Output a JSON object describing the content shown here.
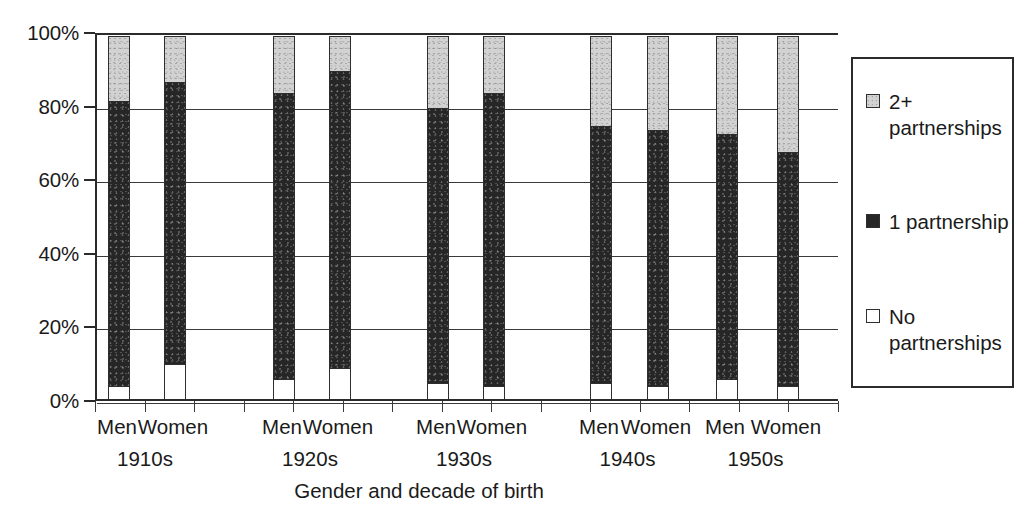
{
  "chart_data": {
    "type": "bar",
    "subtype": "stacked-100-percent-column",
    "title": "",
    "xlabel": "Gender and decade of birth",
    "ylabel": "",
    "ylim": [
      0,
      100
    ],
    "ytick_labels": [
      "0%",
      "20%",
      "40%",
      "60%",
      "80%",
      "100%"
    ],
    "ytick_values": [
      0,
      20,
      40,
      60,
      80,
      100
    ],
    "grid": true,
    "legend_position": "right",
    "categories": [
      "Men 1910s",
      "Women 1910s",
      "Men 1920s",
      "Women 1920s",
      "Men 1930s",
      "Women 1930s",
      "Men 1940s",
      "Women 1940s",
      "Men 1950s",
      "Women 1950s"
    ],
    "group_labels": [
      "1910s",
      "1920s",
      "1930s",
      "1940s",
      "1950s"
    ],
    "gender_labels": [
      "Men",
      "Women"
    ],
    "series": [
      {
        "name": "No partnerships",
        "color": "#ffffff",
        "values": [
          4,
          10,
          6,
          9,
          5,
          4,
          5,
          4,
          6,
          4
        ]
      },
      {
        "name": "1 partnership",
        "color": "#262626",
        "values": [
          78,
          77,
          78,
          81,
          75,
          80,
          70,
          70,
          67,
          64
        ]
      },
      {
        "name": "2+ partnerships",
        "color": "#d2d2d2",
        "values": [
          18,
          13,
          16,
          10,
          20,
          16,
          25,
          26,
          27,
          32
        ]
      }
    ],
    "cumulative_tops": {
      "no_partnerships": [
        4,
        10,
        6,
        9,
        5,
        4,
        5,
        4,
        6,
        4
      ],
      "one_partnership": [
        82,
        87,
        84,
        90,
        80,
        84,
        75,
        74,
        73,
        68
      ],
      "two_plus": [
        100,
        100,
        100,
        100,
        100,
        100,
        100,
        100,
        100,
        100
      ]
    }
  },
  "axis": {
    "x_title": "Gender and decade of birth"
  },
  "legend": {
    "entries": [
      {
        "label": "2+ partnerships",
        "swatch": "light-gray-swatch"
      },
      {
        "label": "1 partnership",
        "swatch": "black-swatch"
      },
      {
        "label": "No partnerships",
        "swatch": "white-swatch"
      }
    ]
  }
}
